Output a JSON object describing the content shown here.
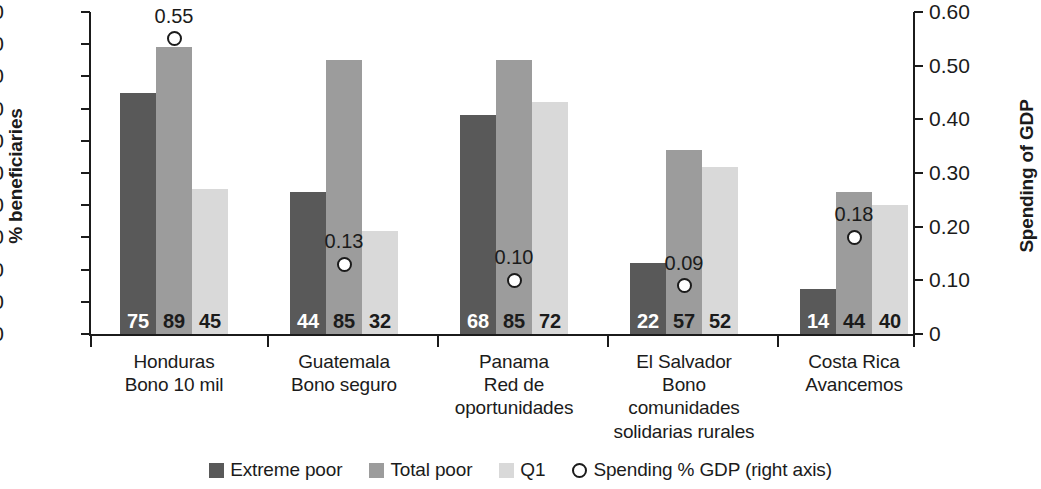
{
  "chart_data": {
    "type": "bar",
    "title": "",
    "xlabel": "",
    "ylabel": "% beneficiaries",
    "y2label": "Spending of GDP",
    "ylim": [
      0,
      100
    ],
    "y2lim": [
      0,
      0.6
    ],
    "grid": false,
    "legend_position": "bottom-center",
    "categories": [
      "Honduras\nBono 10 mil",
      "Guatemala\nBono seguro",
      "Panama\nRed de\noportunidades",
      "El Salvador\nBono\ncomunidades\nsolidarias rurales",
      "Costa Rica\nAvancemos"
    ],
    "series": [
      {
        "name": "Extreme poor",
        "axis": "left",
        "values": [
          75,
          44,
          68,
          22,
          14
        ]
      },
      {
        "name": "Total poor",
        "axis": "left",
        "values": [
          89,
          85,
          85,
          57,
          44
        ]
      },
      {
        "name": "Q1",
        "axis": "left",
        "values": [
          45,
          32,
          72,
          52,
          40
        ]
      },
      {
        "name": "Spending % GDP (right axis)",
        "axis": "right",
        "type": "scatter",
        "values": [
          0.55,
          0.13,
          0.1,
          0.09,
          0.18
        ]
      }
    ],
    "left_ticks": [
      "0",
      "10",
      "20",
      "30",
      "40",
      "50",
      "60",
      "70",
      "80",
      "90",
      "100"
    ],
    "right_ticks": [
      "0",
      "0.10",
      "0.20",
      "0.30",
      "0.40",
      "0.50",
      "0.60"
    ],
    "colors": {
      "extreme_poor": "#595959",
      "total_poor": "#9c9c9c",
      "q1": "#d9d9d9",
      "marker_fill": "#ffffff",
      "marker_stroke": "#1b1b1b",
      "axis": "#1b1b1b",
      "background": "#ffffff"
    }
  },
  "axes": {
    "left_title": "% beneficiaries",
    "right_title": "Spending of GDP",
    "left_ticks": [
      "100",
      "90",
      "80",
      "70",
      "60",
      "50",
      "40",
      "30",
      "20",
      "10",
      "0"
    ],
    "right_ticks": [
      "0.60",
      "0.50",
      "0.40",
      "0.30",
      "0.20",
      "0.10",
      "0"
    ]
  },
  "groups": [
    {
      "lines": [
        "Honduras",
        "Bono 10 mil"
      ],
      "bars": [
        {
          "series": "Extreme poor",
          "value": 75,
          "label": "75"
        },
        {
          "series": "Total poor",
          "value": 89,
          "label": "89"
        },
        {
          "series": "Q1",
          "value": 45,
          "label": "45"
        }
      ],
      "marker": {
        "value": 0.55,
        "label": "0.55"
      }
    },
    {
      "lines": [
        "Guatemala",
        "Bono seguro"
      ],
      "bars": [
        {
          "series": "Extreme poor",
          "value": 44,
          "label": "44"
        },
        {
          "series": "Total poor",
          "value": 85,
          "label": "85"
        },
        {
          "series": "Q1",
          "value": 32,
          "label": "32"
        }
      ],
      "marker": {
        "value": 0.13,
        "label": "0.13"
      }
    },
    {
      "lines": [
        "Panama",
        "Red de",
        "oportunidades"
      ],
      "bars": [
        {
          "series": "Extreme poor",
          "value": 68,
          "label": "68"
        },
        {
          "series": "Total poor",
          "value": 85,
          "label": "85"
        },
        {
          "series": "Q1",
          "value": 72,
          "label": "72"
        }
      ],
      "marker": {
        "value": 0.1,
        "label": "0.10"
      }
    },
    {
      "lines": [
        "El Salvador",
        "Bono",
        "comunidades",
        "solidarias rurales"
      ],
      "bars": [
        {
          "series": "Extreme poor",
          "value": 22,
          "label": "22"
        },
        {
          "series": "Total poor",
          "value": 57,
          "label": "57"
        },
        {
          "series": "Q1",
          "value": 52,
          "label": "52"
        }
      ],
      "marker": {
        "value": 0.09,
        "label": "0.09"
      }
    },
    {
      "lines": [
        "Costa Rica",
        "Avancemos"
      ],
      "bars": [
        {
          "series": "Extreme poor",
          "value": 14,
          "label": "14"
        },
        {
          "series": "Total poor",
          "value": 44,
          "label": "44"
        },
        {
          "series": "Q1",
          "value": 40,
          "label": "40"
        }
      ],
      "marker": {
        "value": 0.18,
        "label": "0.18"
      }
    }
  ],
  "legend": [
    {
      "marker": "square",
      "style": "extreme",
      "label": "Extreme poor"
    },
    {
      "marker": "square",
      "style": "total",
      "label": "Total poor"
    },
    {
      "marker": "square",
      "style": "q1",
      "label": "Q1"
    },
    {
      "marker": "circle",
      "style": "marker",
      "label": "Spending % GDP (right axis)"
    }
  ]
}
